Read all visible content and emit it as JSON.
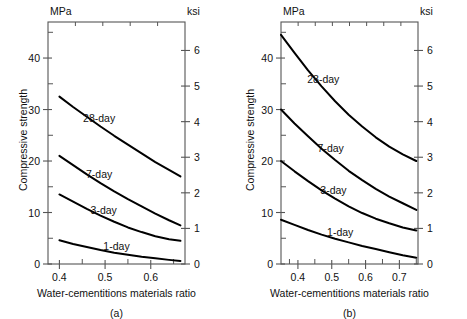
{
  "figure": {
    "background": "#ffffff",
    "curve_color": "#000000",
    "axis_color": "#555555",
    "panels": [
      {
        "id": "a",
        "caption": "(a)",
        "left_unit": "MPa",
        "right_unit": "ksi",
        "ylabel": "Compressive strength",
        "xlabel": "Water-cementitions materials ratio",
        "x_ticks": [
          0.4,
          0.5,
          0.6
        ],
        "x_tick_labels": [
          "0.4",
          "0.5",
          "0.6"
        ],
        "x_minor_ticks": [
          0.45,
          0.55,
          0.65
        ],
        "xlim": [
          0.375,
          0.675
        ],
        "y_ticks_left": [
          0,
          10,
          20,
          30,
          40
        ],
        "y_tick_labels_left": [
          "0",
          "10",
          "20",
          "30",
          "40"
        ],
        "y_minor_ticks_left": [
          5,
          15,
          25,
          35,
          45
        ],
        "ylim_left": [
          0,
          47
        ],
        "y_ticks_right": [
          0,
          1,
          2,
          3,
          4,
          5,
          6
        ],
        "y_tick_labels_right": [
          "0",
          "1",
          "2",
          "3",
          "4",
          "5",
          "6"
        ],
        "ylim_right": [
          0,
          6.8
        ],
        "series": [
          {
            "name": "28-day",
            "label": "28-day",
            "x": [
              0.4,
              0.43,
              0.46,
              0.49,
              0.52,
              0.55,
              0.58,
              0.61,
              0.64,
              0.665
            ],
            "y": [
              32.5,
              30.5,
              28.6,
              26.7,
              24.9,
              23.2,
              21.5,
              19.8,
              18.3,
              17.0
            ]
          },
          {
            "name": "7-day",
            "label": "7-day",
            "x": [
              0.4,
              0.43,
              0.46,
              0.49,
              0.52,
              0.55,
              0.58,
              0.61,
              0.64,
              0.665
            ],
            "y": [
              21.0,
              19.2,
              17.4,
              15.7,
              14.1,
              12.6,
              11.2,
              9.8,
              8.5,
              7.5
            ]
          },
          {
            "name": "3-day",
            "label": "3-day",
            "x": [
              0.4,
              0.43,
              0.46,
              0.49,
              0.52,
              0.55,
              0.58,
              0.61,
              0.64,
              0.665
            ],
            "y": [
              13.5,
              12.1,
              10.7,
              9.4,
              8.2,
              7.1,
              6.2,
              5.4,
              4.8,
              4.5
            ]
          },
          {
            "name": "1-day",
            "label": "1-day",
            "x": [
              0.4,
              0.43,
              0.46,
              0.49,
              0.52,
              0.55,
              0.58,
              0.61,
              0.64,
              0.665
            ],
            "y": [
              4.6,
              3.9,
              3.3,
              2.7,
              2.2,
              1.8,
              1.4,
              1.1,
              0.8,
              0.6
            ]
          }
        ]
      },
      {
        "id": "b",
        "caption": "(b)",
        "left_unit": "MPa",
        "right_unit": "ksi",
        "ylabel": "Compressive strength",
        "xlabel": "Water-cementitions materials ratio",
        "x_ticks": [
          0.4,
          0.5,
          0.6,
          0.7
        ],
        "x_tick_labels": [
          "0.4",
          "0.5",
          "0.6",
          "0.7"
        ],
        "x_minor_ticks": [
          0.375,
          0.45,
          0.55,
          0.65,
          0.75
        ],
        "xlim": [
          0.35,
          0.755
        ],
        "y_ticks_left": [
          0,
          10,
          20,
          30,
          40
        ],
        "y_tick_labels_left": [
          "0",
          "10",
          "20",
          "30",
          "40"
        ],
        "y_minor_ticks_left": [
          5,
          15,
          25,
          35,
          45
        ],
        "ylim_left": [
          0,
          47
        ],
        "y_ticks_right": [
          0,
          1,
          2,
          3,
          4,
          5,
          6
        ],
        "y_tick_labels_right": [
          "0",
          "1",
          "2",
          "3",
          "4",
          "5",
          "6"
        ],
        "ylim_right": [
          0,
          6.8
        ],
        "series": [
          {
            "name": "28-day",
            "label": "28-day",
            "x": [
              0.35,
              0.39,
              0.43,
              0.47,
              0.51,
              0.55,
              0.59,
              0.63,
              0.67,
              0.71,
              0.75
            ],
            "y": [
              44.5,
              41.0,
              37.6,
              34.5,
              31.6,
              29.0,
              26.7,
              24.6,
              22.8,
              21.3,
              20.0
            ]
          },
          {
            "name": "7-day",
            "label": "7-day",
            "x": [
              0.35,
              0.39,
              0.43,
              0.47,
              0.51,
              0.55,
              0.59,
              0.63,
              0.67,
              0.71,
              0.75
            ],
            "y": [
              30.0,
              27.3,
              24.8,
              22.4,
              20.2,
              18.1,
              16.3,
              14.6,
              13.1,
              11.8,
              10.5
            ]
          },
          {
            "name": "3-day",
            "label": "3-day",
            "x": [
              0.35,
              0.39,
              0.43,
              0.47,
              0.51,
              0.55,
              0.59,
              0.63,
              0.67,
              0.71,
              0.75
            ],
            "y": [
              20.0,
              18.0,
              16.1,
              14.3,
              12.7,
              11.2,
              9.9,
              8.8,
              7.9,
              7.1,
              6.5
            ]
          },
          {
            "name": "1-day",
            "label": "1-day",
            "x": [
              0.35,
              0.39,
              0.43,
              0.47,
              0.51,
              0.55,
              0.59,
              0.63,
              0.67,
              0.71,
              0.75
            ],
            "y": [
              8.6,
              7.6,
              6.6,
              5.7,
              4.9,
              4.2,
              3.5,
              2.9,
              2.3,
              1.7,
              1.2
            ]
          }
        ]
      }
    ]
  },
  "chart_data": {
    "type": "line",
    "title": "",
    "subtitle": "",
    "panels": [
      "(a)",
      "(b)"
    ],
    "xlabel": "Water-cementitions materials ratio",
    "ylabel": "Compressive strength",
    "y_unit_left": "MPa",
    "y_unit_right": "ksi",
    "grid": false,
    "legend": "inline curve labels",
    "panel_a": {
      "xlim": [
        0.375,
        0.675
      ],
      "ylim": [
        0,
        47
      ],
      "ylim_ksi": [
        0,
        6.8
      ],
      "xticks": [
        0.4,
        0.5,
        0.6
      ],
      "yticks": [
        0,
        10,
        20,
        30,
        40
      ],
      "yticks_ksi": [
        0,
        1,
        2,
        3,
        4,
        5,
        6
      ],
      "x": [
        0.4,
        0.43,
        0.46,
        0.49,
        0.52,
        0.55,
        0.58,
        0.61,
        0.64,
        0.665
      ],
      "series": [
        {
          "name": "28-day",
          "values": [
            32.5,
            30.5,
            28.6,
            26.7,
            24.9,
            23.2,
            21.5,
            19.8,
            18.3,
            17.0
          ]
        },
        {
          "name": "7-day",
          "values": [
            21.0,
            19.2,
            17.4,
            15.7,
            14.1,
            12.6,
            11.2,
            9.8,
            8.5,
            7.5
          ]
        },
        {
          "name": "3-day",
          "values": [
            13.5,
            12.1,
            10.7,
            9.4,
            8.2,
            7.1,
            6.2,
            5.4,
            4.8,
            4.5
          ]
        },
        {
          "name": "1-day",
          "values": [
            4.6,
            3.9,
            3.3,
            2.7,
            2.2,
            1.8,
            1.4,
            1.1,
            0.8,
            0.6
          ]
        }
      ]
    },
    "panel_b": {
      "xlim": [
        0.35,
        0.755
      ],
      "ylim": [
        0,
        47
      ],
      "ylim_ksi": [
        0,
        6.8
      ],
      "xticks": [
        0.4,
        0.5,
        0.6,
        0.7
      ],
      "yticks": [
        0,
        10,
        20,
        30,
        40
      ],
      "yticks_ksi": [
        0,
        1,
        2,
        3,
        4,
        5,
        6
      ],
      "x": [
        0.35,
        0.39,
        0.43,
        0.47,
        0.51,
        0.55,
        0.59,
        0.63,
        0.67,
        0.71,
        0.75
      ],
      "series": [
        {
          "name": "28-day",
          "values": [
            44.5,
            41.0,
            37.6,
            34.5,
            31.6,
            29.0,
            26.7,
            24.6,
            22.8,
            21.3,
            20.0
          ]
        },
        {
          "name": "7-day",
          "values": [
            30.0,
            27.3,
            24.8,
            22.4,
            20.2,
            18.1,
            16.3,
            14.6,
            13.1,
            11.8,
            10.5
          ]
        },
        {
          "name": "3-day",
          "values": [
            20.0,
            18.0,
            16.1,
            14.3,
            12.7,
            11.2,
            9.9,
            8.8,
            7.9,
            7.1,
            6.5
          ]
        },
        {
          "name": "1-day",
          "values": [
            8.6,
            7.6,
            6.6,
            5.7,
            4.9,
            4.2,
            3.5,
            2.9,
            2.3,
            1.7,
            1.2
          ]
        }
      ]
    }
  }
}
